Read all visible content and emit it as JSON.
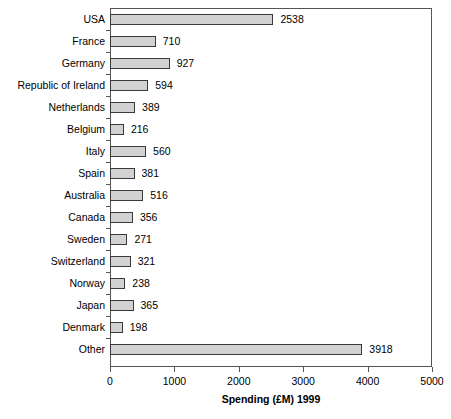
{
  "chart_data": {
    "type": "bar",
    "orientation": "horizontal",
    "title": "",
    "xlabel": "Spending (£M) 1999",
    "ylabel": "",
    "xlim": [
      0,
      5000
    ],
    "xticks": [
      0,
      1000,
      2000,
      3000,
      4000,
      5000
    ],
    "xtick_labels": [
      "0",
      "1000",
      "2000",
      "3000",
      "4000",
      "5000"
    ],
    "grid": false,
    "legend": false,
    "show_value_labels": true,
    "bar_fill_color": "#d2d2d2",
    "bar_border_color": "#3a3a3a",
    "axis_color": "#555555",
    "background_color": "#ffffff",
    "categories": [
      "USA",
      "France",
      "Germany",
      "Republic of Ireland",
      "Netherlands",
      "Belgium",
      "Italy",
      "Spain",
      "Australia",
      "Canada",
      "Sweden",
      "Switzerland",
      "Norway",
      "Japan",
      "Denmark",
      "Other"
    ],
    "values": [
      2538,
      710,
      927,
      594,
      389,
      216,
      560,
      381,
      516,
      356,
      271,
      321,
      238,
      365,
      198,
      3918
    ],
    "value_labels": [
      "2538",
      "710",
      "927",
      "594",
      "389",
      "216",
      "560",
      "381",
      "516",
      "356",
      "271",
      "321",
      "238",
      "365",
      "198",
      "3918"
    ]
  }
}
